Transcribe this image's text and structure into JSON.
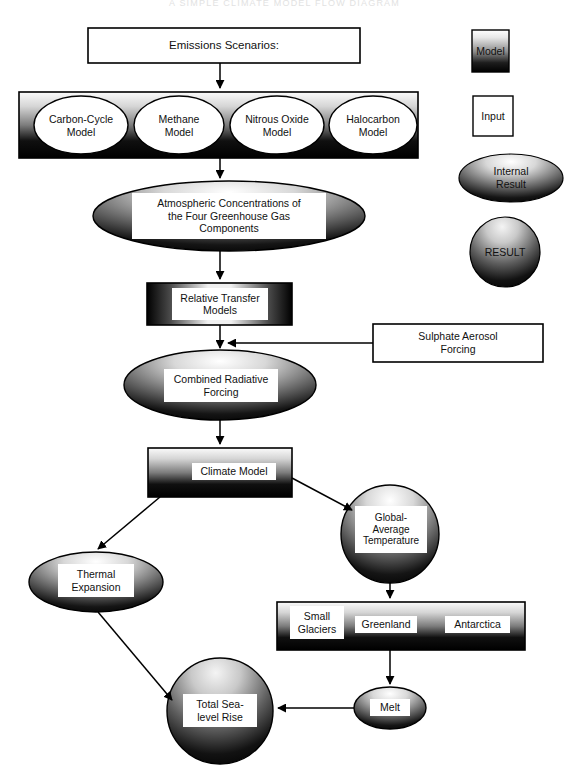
{
  "figure": {
    "header_faint_text": "A SIMPLE CLIMATE MODEL FLOW DIAGRAM",
    "type": "flow-diagram"
  },
  "legend": {
    "items": [
      {
        "key": "model",
        "label": "Model",
        "shape": "rect-gradient-vertical"
      },
      {
        "key": "input",
        "label": "Input",
        "shape": "rect-white-outline"
      },
      {
        "key": "internal_result",
        "label": "Internal\nResult",
        "shape": "ellipse-gradient"
      },
      {
        "key": "result",
        "label": "RESULT",
        "shape": "circle-gradient"
      }
    ]
  },
  "nodes": {
    "emissions_scenarios": {
      "label": "Emissions Scenarios:",
      "kind": "input"
    },
    "carbon_cycle_model": {
      "label": "Carbon-Cycle\nModel",
      "kind": "model"
    },
    "methane_model": {
      "label": "Methane\nModel",
      "kind": "model"
    },
    "nitrous_oxide_model": {
      "label": "Nitrous Oxide\nModel",
      "kind": "model"
    },
    "halocarbon_model": {
      "label": "Halocarbon\nModel",
      "kind": "model"
    },
    "atmospheric_concentrations": {
      "label": "Atmospheric Concentrations of\nthe Four Greenhouse Gas\nComponents",
      "kind": "internal_result"
    },
    "relative_transfer_models": {
      "label": "Relative Transfer\nModels",
      "kind": "model"
    },
    "sulphate_aerosol_forcing": {
      "label": "Sulphate Aerosol\nForcing",
      "kind": "input"
    },
    "combined_radiative_forcing": {
      "label": "Combined Radiative\nForcing",
      "kind": "internal_result"
    },
    "climate_model": {
      "label": "Climate Model",
      "kind": "model"
    },
    "global_average_temperature": {
      "label": "Global-\nAverage\nTemperature",
      "kind": "internal_result"
    },
    "thermal_expansion": {
      "label": "Thermal\nExpansion",
      "kind": "internal_result"
    },
    "small_glaciers": {
      "label": "Small\nGlaciers",
      "kind": "model"
    },
    "greenland": {
      "label": "Greenland",
      "kind": "model"
    },
    "antarctica": {
      "label": "Antarctica",
      "kind": "model"
    },
    "melt": {
      "label": "Melt",
      "kind": "internal_result"
    },
    "total_sea_level_rise": {
      "label": "Total Sea-\nlevel Rise",
      "kind": "result"
    }
  },
  "colors": {
    "stroke": "#000000",
    "page_background": "#ffffff",
    "gradient_light": "#f2f2f2",
    "gradient_dark": "#000000",
    "text": "#111111"
  }
}
